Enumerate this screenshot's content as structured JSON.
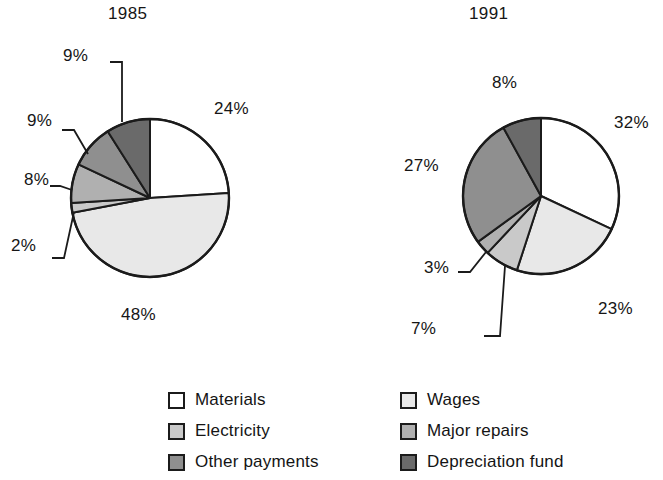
{
  "chart_data": {
    "type": "pie",
    "title": "",
    "subtitle": "",
    "xlabel": "",
    "ylabel": "",
    "legend_position": "bottom",
    "grid": false,
    "value_unit": "%",
    "categories": [
      "Materials",
      "Wages",
      "Electricity",
      "Major repairs",
      "Other payments",
      "Depreciation fund"
    ],
    "colors": [
      "#ffffff",
      "#e8e8e8",
      "#c9c9c9",
      "#b0b0b0",
      "#8f8f8f",
      "#6a6a6a"
    ],
    "charts": [
      {
        "title": "1985",
        "slices": [
          {
            "label": "Materials",
            "value": 24,
            "display": "24%",
            "color": "#ffffff"
          },
          {
            "label": "Wages",
            "value": 48,
            "display": "48%",
            "color": "#e8e8e8"
          },
          {
            "label": "Electricity",
            "value": 2,
            "display": "2%",
            "color": "#c9c9c9"
          },
          {
            "label": "Major repairs",
            "value": 8,
            "display": "8%",
            "color": "#b0b0b0"
          },
          {
            "label": "Other payments",
            "value": 9,
            "display": "9%",
            "color": "#8f8f8f"
          },
          {
            "label": "Depreciation fund",
            "value": 9,
            "display": "9%",
            "color": "#6a6a6a"
          }
        ]
      },
      {
        "title": "1991",
        "slices": [
          {
            "label": "Materials",
            "value": 32,
            "display": "32%",
            "color": "#ffffff"
          },
          {
            "label": "Wages",
            "value": 23,
            "display": "23%",
            "color": "#e8e8e8"
          },
          {
            "label": "Electricity",
            "value": 7,
            "display": "7%",
            "color": "#c9c9c9"
          },
          {
            "label": "Major repairs",
            "value": 3,
            "display": "3%",
            "color": "#b0b0b0"
          },
          {
            "label": "Other payments",
            "value": 27,
            "display": "27%",
            "color": "#8f8f8f"
          },
          {
            "label": "Depreciation fund",
            "value": 8,
            "display": "8%",
            "color": "#6a6a6a"
          }
        ]
      }
    ]
  },
  "charts": {
    "left": {
      "title": "1985",
      "labels": {
        "materials": "24%",
        "wages": "48%",
        "electricity": "2%",
        "major_repairs": "8%",
        "other_payments": "9%",
        "depreciation_fund": "9%"
      }
    },
    "right": {
      "title": "1991",
      "labels": {
        "materials": "32%",
        "wages": "23%",
        "electricity": "7%",
        "major_repairs": "3%",
        "other_payments": "27%",
        "depreciation_fund": "8%"
      }
    }
  },
  "legend": {
    "left_column": [
      {
        "label": "Materials",
        "color": "#ffffff"
      },
      {
        "label": "Electricity",
        "color": "#c9c9c9"
      },
      {
        "label": "Other payments",
        "color": "#8f8f8f"
      }
    ],
    "right_column": [
      {
        "label": "Wages",
        "color": "#e8e8e8"
      },
      {
        "label": "Major repairs",
        "color": "#b0b0b0"
      },
      {
        "label": "Depreciation fund",
        "color": "#6a6a6a"
      }
    ]
  }
}
